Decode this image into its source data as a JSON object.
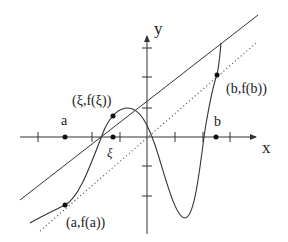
{
  "diagram": {
    "colors": {
      "stroke": "#333333",
      "dotted": "#555555",
      "point": "#111111",
      "background": "#ffffff"
    },
    "axes": {
      "x_label": "x",
      "y_label": "y",
      "x_ticks_px": [
        38,
        92,
        120,
        175,
        203,
        230
      ],
      "y_ticks_px": [
        48,
        77,
        108,
        166,
        196
      ]
    },
    "labels": {
      "a": "a",
      "b": "b",
      "xi": "ξ",
      "point_a": "(a,f(a))",
      "point_b": "(b,f(b))",
      "point_xi": "(ξ,f(ξ))"
    },
    "lines": {
      "tangent": "solid line tangent at ξ",
      "secant": "dotted line parallel to chord from a to b"
    }
  }
}
